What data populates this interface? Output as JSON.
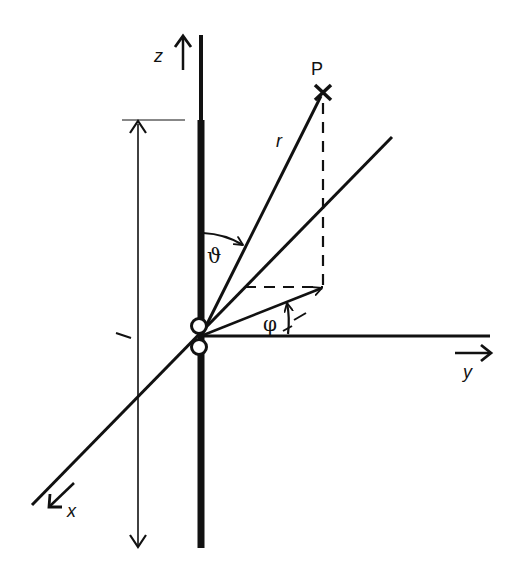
{
  "diagram": {
    "type": "coordinate-system-dipole",
    "labels": {
      "z_axis": "z",
      "y_axis": "y",
      "x_axis": "x",
      "point": "P",
      "radius": "r",
      "theta": "ϑ",
      "phi": "φ",
      "length": "l"
    },
    "colors": {
      "line": "#111111",
      "background": "#ffffff"
    },
    "geometry": {
      "origin": [
        201,
        336
      ],
      "point_P": [
        323,
        92
      ],
      "projection": [
        323,
        287
      ],
      "y_axis_end": [
        490,
        336
      ],
      "x_axis_start": [
        32,
        505
      ],
      "x_axis_end": [
        392,
        137
      ],
      "z_axis_top": [
        201,
        35
      ],
      "z_axis_bottom": [
        201,
        548
      ],
      "length_dimension": {
        "x": 138,
        "top": 120,
        "bottom": 548
      }
    }
  }
}
